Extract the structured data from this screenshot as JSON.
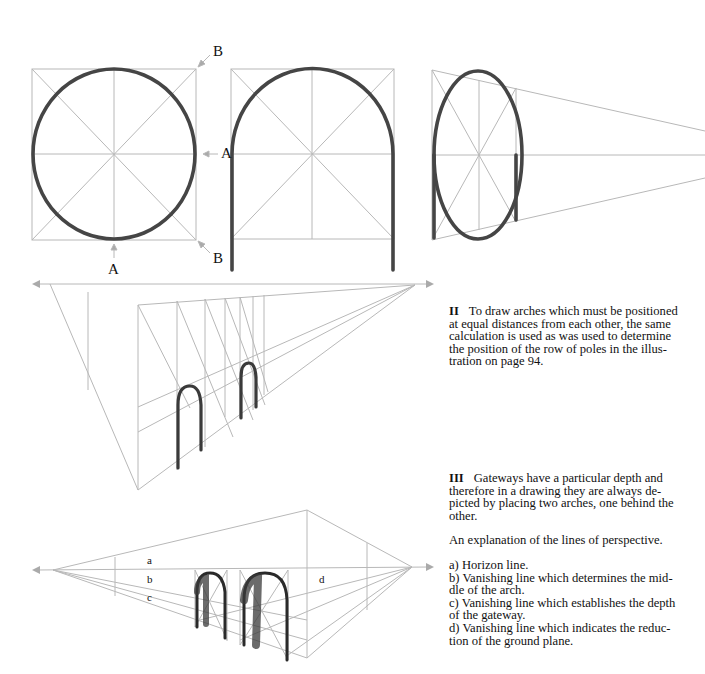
{
  "figure_I": {
    "labels": {
      "A_right": "A",
      "A_bottom": "A",
      "B_top": "B",
      "B_bottom": "B"
    }
  },
  "figure_III": {
    "labels": {
      "a": "a",
      "b": "b",
      "c": "c",
      "d": "d"
    }
  },
  "text": {
    "section_II": {
      "numeral": "II",
      "body": "To draw arches which must be positioned at equal distances from each other, the same calculation is used as was used to determine the position of the row of poles in the illustration on page 94.",
      "lines": [
        "To draw arches which must be positioned",
        "at equal distances from each other, the same",
        "calculation is used as was used to determine",
        "the position of the row of poles in the illus-",
        "tration on page 94."
      ]
    },
    "section_III": {
      "numeral": "III",
      "lines": [
        "Gateways have a particular depth and",
        "therefore in a drawing they are always de-",
        "picted by placing two arches, one behind the",
        "other."
      ]
    },
    "explanation_heading": "An explanation of the lines of perspective.",
    "legend": [
      {
        "key": "a",
        "lines": [
          "a) Horizon line."
        ]
      },
      {
        "key": "b",
        "lines": [
          "b) Vanishing line which determines the mid-",
          "dle of the arch."
        ]
      },
      {
        "key": "c",
        "lines": [
          "c) Vanishing line which establishes the depth",
          "of the gateway."
        ]
      },
      {
        "key": "d",
        "lines": [
          "d) Vanishing line which indicates the reduc-",
          "tion of the ground plane."
        ]
      }
    ]
  },
  "colors": {
    "guide": "#b4b4b4",
    "ink": "#3a3a3a",
    "text": "#111111"
  }
}
